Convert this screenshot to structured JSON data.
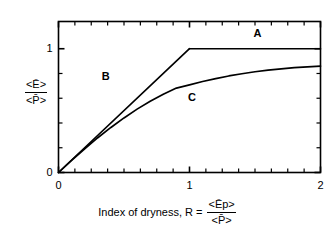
{
  "chart_data": {
    "type": "line",
    "title": "",
    "subtitle": "",
    "xlabel": "Index of dryness,  R =",
    "xlabel_fraction": {
      "numerator": "<Ēp>",
      "denominator": "<P̄>"
    },
    "ylabel_fraction": {
      "numerator": "<Ē>",
      "denominator": "<P̄>"
    },
    "xlim": [
      0,
      2
    ],
    "ylim": [
      0,
      1.22
    ],
    "xticks": [
      0,
      1,
      2
    ],
    "xticklabels": [
      "0",
      "1",
      "2"
    ],
    "yticks": [
      0,
      1
    ],
    "yticklabels": [
      "0",
      "1"
    ],
    "x_minor_tick_step": 0.125,
    "y_minor_tick_step": 0.2,
    "grid": false,
    "legend_position": "inline-annotations",
    "series": [
      {
        "name": "A",
        "label": "A",
        "description": "Energy limit: horizontal line at ratio 1 for R >= 1",
        "points": [
          [
            1.0,
            1.0
          ],
          [
            2.0,
            1.0
          ]
        ]
      },
      {
        "name": "B",
        "label": "B",
        "description": "Water limit: straight line of slope 1 from origin to (1,1)",
        "points": [
          [
            0.0,
            0.0
          ],
          [
            1.0,
            1.0
          ]
        ]
      },
      {
        "name": "C",
        "label": "C",
        "description": "Budyko-type curve rising from origin, concave, approaching 1",
        "points": [
          [
            0.0,
            0.0
          ],
          [
            0.1,
            0.098
          ],
          [
            0.2,
            0.192
          ],
          [
            0.3,
            0.281
          ],
          [
            0.4,
            0.364
          ],
          [
            0.5,
            0.441
          ],
          [
            0.6,
            0.512
          ],
          [
            0.7,
            0.576
          ],
          [
            0.8,
            0.633
          ],
          [
            0.9,
            0.682
          ],
          [
            1.0,
            0.708
          ],
          [
            1.1,
            0.735
          ],
          [
            1.2,
            0.759
          ],
          [
            1.3,
            0.78
          ],
          [
            1.4,
            0.798
          ],
          [
            1.5,
            0.814
          ],
          [
            1.6,
            0.827
          ],
          [
            1.7,
            0.838
          ],
          [
            1.8,
            0.847
          ],
          [
            1.9,
            0.854
          ],
          [
            2.0,
            0.86
          ]
        ]
      }
    ],
    "annotations": [
      {
        "text": "A",
        "x": 1.52,
        "y": 1.12
      },
      {
        "text": "B",
        "x": 0.36,
        "y": 0.77
      },
      {
        "text": "C",
        "x": 1.02,
        "y": 0.6
      }
    ],
    "colors": {
      "line": "#000000",
      "background": "#ffffff",
      "axis": "#000000"
    }
  }
}
